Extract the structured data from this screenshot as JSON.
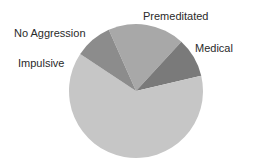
{
  "chart_data": {
    "type": "pie",
    "title": "",
    "categories": [
      "Premeditated",
      "Medical",
      "Impulsive",
      "No Aggression"
    ],
    "values": [
      18.5,
      9.5,
      63,
      9
    ],
    "colors": [
      "#a8a8a8",
      "#7a7a7a",
      "#c6c6c6",
      "#8c8c8c"
    ],
    "start_angle_deg": 336,
    "direction": "clockwise",
    "legend": "none",
    "labels_outside": true
  },
  "labels": {
    "premeditated": "Premeditated",
    "medical": "Medical",
    "impulsive": "Impulsive",
    "no_aggression": "No Aggression"
  }
}
